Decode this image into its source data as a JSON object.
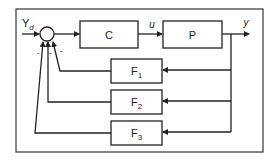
{
  "diagram": {
    "type": "feedback-control-block-diagram",
    "input_label": "Y",
    "input_subscript": "d",
    "output_label": "y",
    "control_signal_label": "u",
    "summing_junction_signs": [
      "-",
      "-",
      "-"
    ],
    "blocks": {
      "controller": "C",
      "plant": "P",
      "feedback": [
        {
          "name": "F",
          "subscript": "1"
        },
        {
          "name": "F",
          "subscript": "2"
        },
        {
          "name": "F",
          "subscript": "3"
        }
      ]
    },
    "colors": {
      "line": "#222222",
      "background": "#ffffff"
    }
  }
}
